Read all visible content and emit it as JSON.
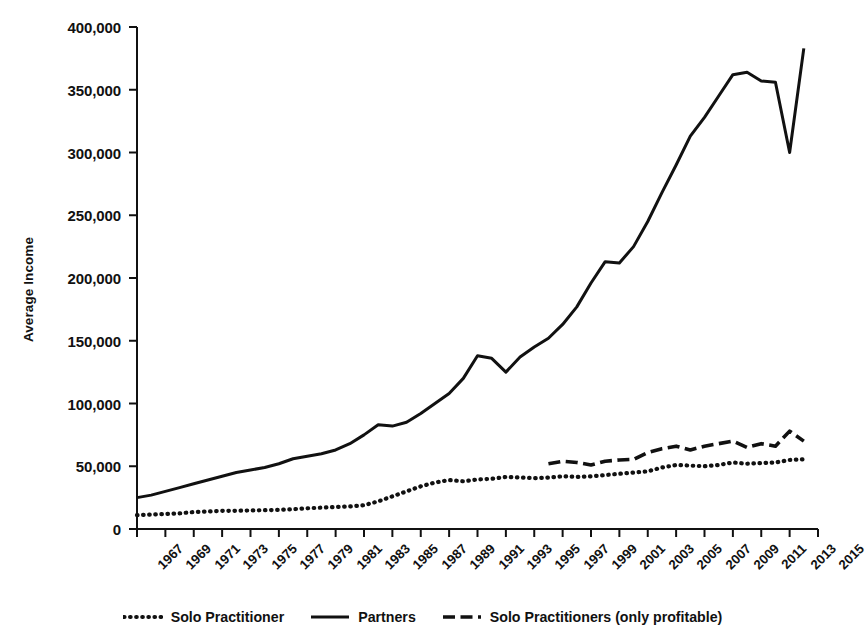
{
  "chart_data": {
    "type": "line",
    "title": "",
    "xlabel": "",
    "ylabel": "Average Income",
    "xlim": [
      1967,
      2015
    ],
    "ylim": [
      0,
      400000
    ],
    "grid": false,
    "legend_position": "bottom-center",
    "ytick_labels": [
      "400,000",
      "350,000",
      "300,000",
      "250,000",
      "200,000",
      "150,000",
      "100,000",
      "50,000",
      "0"
    ],
    "ytick_values": [
      400000,
      350000,
      300000,
      250000,
      200000,
      150000,
      100000,
      50000,
      0
    ],
    "xtick_labels": [
      "1967",
      "1969",
      "1971",
      "1973",
      "1975",
      "1977",
      "1979",
      "1981",
      "1983",
      "1985",
      "1987",
      "1989",
      "1991",
      "1993",
      "1995",
      "1997",
      "1999",
      "2001",
      "2003",
      "2005",
      "2007",
      "2009",
      "2011",
      "2013",
      "2015"
    ],
    "x": [
      1967,
      1968,
      1969,
      1970,
      1971,
      1972,
      1973,
      1974,
      1975,
      1976,
      1977,
      1978,
      1979,
      1980,
      1981,
      1982,
      1983,
      1984,
      1985,
      1986,
      1987,
      1988,
      1989,
      1990,
      1991,
      1992,
      1993,
      1994,
      1995,
      1996,
      1997,
      1998,
      1999,
      2000,
      2001,
      2002,
      2003,
      2004,
      2005,
      2006,
      2007,
      2008,
      2009,
      2010,
      2011,
      2012,
      2013,
      2014
    ],
    "series": [
      {
        "name": "Solo Practitioner",
        "style": "dotted",
        "color": "#111111",
        "x": [
          1967,
          1968,
          1969,
          1970,
          1971,
          1972,
          1973,
          1974,
          1975,
          1976,
          1977,
          1978,
          1979,
          1980,
          1981,
          1982,
          1983,
          1984,
          1985,
          1986,
          1987,
          1988,
          1989,
          1990,
          1991,
          1992,
          1993,
          1994,
          1995,
          1996,
          1997,
          1998,
          1999,
          2000,
          2001,
          2002,
          2003,
          2004,
          2005,
          2006,
          2007,
          2008,
          2009,
          2010,
          2011,
          2012,
          2013,
          2014
        ],
        "values": [
          11000,
          11500,
          12000,
          12500,
          13500,
          14000,
          14500,
          14500,
          14800,
          15000,
          15200,
          15800,
          16500,
          17000,
          17500,
          18000,
          19000,
          22000,
          26000,
          30000,
          34000,
          37000,
          39000,
          38000,
          39500,
          40000,
          41500,
          41000,
          40500,
          41000,
          42000,
          41500,
          42000,
          43000,
          44000,
          45000,
          46000,
          49000,
          51000,
          50500,
          50000,
          51000,
          53000,
          52000,
          52500,
          53000,
          55000,
          55500
        ]
      },
      {
        "name": "Partners",
        "style": "solid",
        "color": "#111111",
        "x": [
          1967,
          1968,
          1969,
          1970,
          1971,
          1972,
          1973,
          1974,
          1975,
          1976,
          1977,
          1978,
          1979,
          1980,
          1981,
          1982,
          1983,
          1984,
          1985,
          1986,
          1987,
          1988,
          1989,
          1990,
          1991,
          1992,
          1993,
          1994,
          1995,
          1996,
          1997,
          1998,
          1999,
          2000,
          2001,
          2002,
          2003,
          2004,
          2005,
          2006,
          2007,
          2008,
          2009,
          2010,
          2011,
          2012,
          2013,
          2014
        ],
        "values": [
          25000,
          27000,
          30000,
          33000,
          36000,
          39000,
          42000,
          45000,
          47000,
          49000,
          52000,
          56000,
          58000,
          60000,
          63000,
          68000,
          75000,
          83000,
          82000,
          85000,
          92000,
          100000,
          108000,
          120000,
          138000,
          136000,
          125000,
          137000,
          145000,
          152000,
          163000,
          177000,
          196000,
          213000,
          212000,
          225000,
          245000,
          268000,
          290000,
          313000,
          328000,
          345000,
          362000,
          364000,
          357000,
          356000,
          300000,
          383000
        ]
      },
      {
        "name": "Solo Practitioners (only profitable)",
        "style": "dashed",
        "color": "#111111",
        "x": [
          1996,
          1997,
          1998,
          1999,
          2000,
          2001,
          2002,
          2003,
          2004,
          2005,
          2006,
          2007,
          2008,
          2009,
          2010,
          2011,
          2012,
          2013,
          2014
        ],
        "values": [
          52000,
          54000,
          53000,
          51000,
          54000,
          55000,
          55500,
          61000,
          64000,
          66000,
          63000,
          66000,
          68000,
          70000,
          65000,
          68000,
          66000,
          78000,
          70000
        ]
      }
    ]
  },
  "legend": {
    "items": [
      {
        "label": "Solo Practitioner",
        "key": "dotted-line-key"
      },
      {
        "label": "Partners",
        "key": "solid-line-key"
      },
      {
        "label": "Solo Practitioners (only profitable)",
        "key": "dashed-line-key"
      }
    ]
  }
}
